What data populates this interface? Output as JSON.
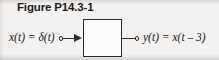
{
  "figure": {
    "caption": "Figure P14.3-1",
    "input_label": "x(t) = δ(t)",
    "output_label": "y(t) = x(t – 3)",
    "block_label": "",
    "colors": {
      "background": "#f3f2f0",
      "ink": "#1a1a1a",
      "line": "#2e2e2e",
      "block_fill": "#fbfbfa"
    },
    "icons": {
      "input_terminal": "open-circle-terminal",
      "output_terminal": "open-circle-terminal",
      "flow_arrow": "arrowhead-right"
    }
  }
}
